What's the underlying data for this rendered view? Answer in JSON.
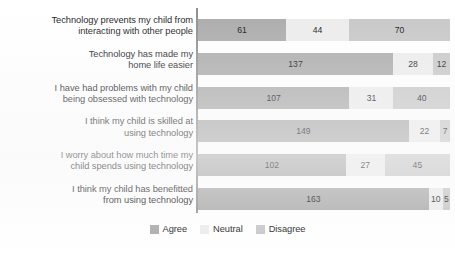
{
  "chart_data": {
    "type": "bar",
    "subtype": "stacked-horizontal",
    "title": "",
    "xlabel": "",
    "ylabel": "",
    "grid": false,
    "legend_position": "bottom-center",
    "stacked_totals": [
      175,
      177,
      178,
      178,
      174,
      178
    ],
    "categories": [
      "Technology prevents my child from interacting with other people",
      "Technology has made my home life easier",
      "I have had problems with my child being obsessed with technology",
      "I think my child is skilled at using technology",
      "I worry about how much time my child spends using technology",
      "I think my child has benefitted from using technology"
    ],
    "category_lines": [
      [
        "Technology prevents my child from",
        "interacting with other people"
      ],
      [
        "Technology has made my",
        "home life easier"
      ],
      [
        "I have had problems with my child",
        "being obsessed with technology"
      ],
      [
        "I think my child is skilled at",
        "using technology"
      ],
      [
        "I worry about how much time my",
        "child spends using technology"
      ],
      [
        "I think my child has benefitted",
        "from using technology"
      ]
    ],
    "series": [
      {
        "name": "Agree",
        "color": "#a9a9a9",
        "values": [
          61,
          137,
          107,
          149,
          102,
          163
        ]
      },
      {
        "name": "Neutral",
        "color": "#ececec",
        "values": [
          44,
          28,
          31,
          22,
          27,
          10
        ]
      },
      {
        "name": "Disagree",
        "color": "#c6c6c6",
        "values": [
          70,
          12,
          40,
          7,
          45,
          5
        ]
      }
    ]
  },
  "legend": {
    "items": [
      {
        "label": "Agree",
        "color": "#a9a9a9"
      },
      {
        "label": "Neutral",
        "color": "#ececec"
      },
      {
        "label": "Disagree",
        "color": "#c6c6c6"
      }
    ]
  }
}
